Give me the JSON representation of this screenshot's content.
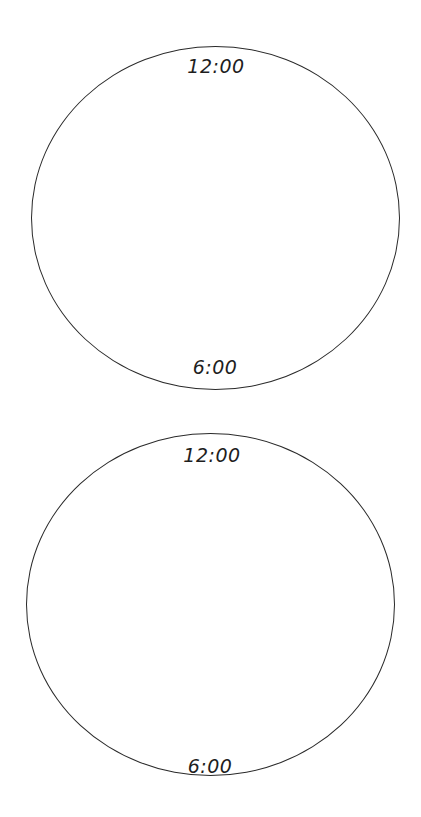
{
  "clocks": [
    {
      "top_label": "12:00",
      "bottom_label": "6:00"
    },
    {
      "top_label": "12:00",
      "bottom_label": "6:00"
    }
  ],
  "colors": {
    "outline": "#2a2a2a",
    "text": "#1e1e1e",
    "background": "#ffffff"
  }
}
